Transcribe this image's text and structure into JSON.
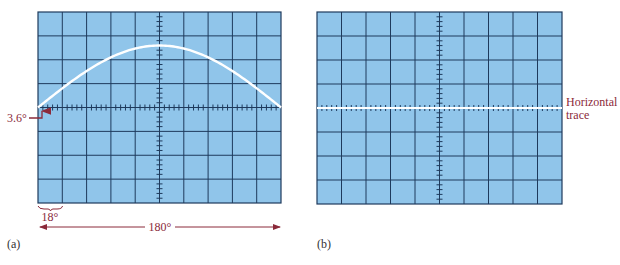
{
  "colors": {
    "screen_fill": "#90c5ea",
    "grid_line": "#1e3a5c",
    "trace": "#ffffff",
    "annotation": "#8b2a3a",
    "caption": "#333333"
  },
  "panel_a": {
    "caption": "(a)",
    "grid": {
      "cols": 10,
      "rows": 8,
      "minor_ticks_per_division": 5
    },
    "trace": "half-sine from 0° to 180°, peak ≈ 2.6 divisions above center",
    "annotations": {
      "start_offset_label": "3.6°",
      "division_label": "18°",
      "span_label": "180°"
    }
  },
  "panel_b": {
    "caption": "(b)",
    "grid": {
      "cols": 10,
      "rows": 8,
      "minor_ticks_per_division": 5
    },
    "trace": "flat horizontal line at center",
    "annotations": {
      "trace_label_line1": "Horizontal",
      "trace_label_line2": "trace"
    }
  }
}
